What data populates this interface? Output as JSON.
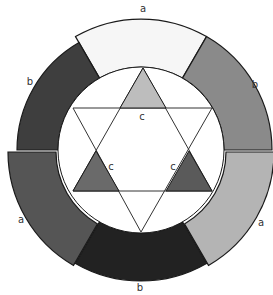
{
  "diagram": {
    "title": "",
    "type": "color-wheel",
    "segments": [
      {
        "id": "top",
        "label": "a",
        "color": "#f6f6f6"
      },
      {
        "id": "top-right",
        "label": "b",
        "color": "#8a8a8a"
      },
      {
        "id": "bottom-right",
        "label": "a",
        "color": "#b4b4b4"
      },
      {
        "id": "bottom",
        "label": "b",
        "color": "#222222"
      },
      {
        "id": "bottom-left",
        "label": "a",
        "color": "#555555"
      },
      {
        "id": "top-left",
        "label": "b",
        "color": "#3e3e3e"
      }
    ],
    "triangles": [
      {
        "id": "top",
        "label": "c",
        "color": "#bdbdbd"
      },
      {
        "id": "left",
        "label": "c",
        "color": "#6a6a6a"
      },
      {
        "id": "right",
        "label": "c",
        "color": "#5a5a5a"
      }
    ]
  }
}
